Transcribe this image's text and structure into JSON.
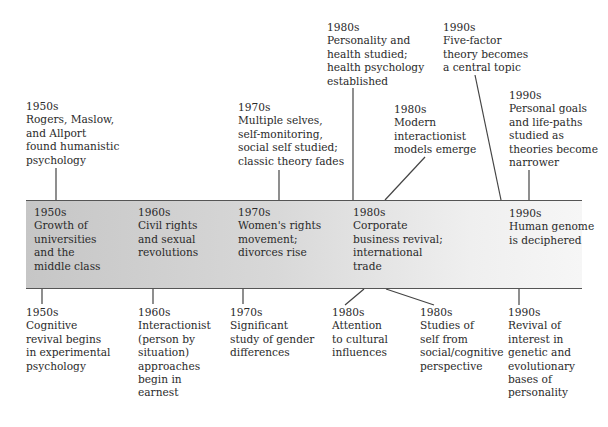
{
  "timeline": {
    "band_colors": {
      "left": "#c6c6c6",
      "right": "#f6f6f6",
      "border": "#555555"
    },
    "above": [
      {
        "era": "1950s",
        "lines": [
          "Rogers, Maslow,",
          "and Allport",
          "found humanistic",
          "psychology"
        ]
      },
      {
        "era": "1970s",
        "lines": [
          "Multiple selves,",
          "self-monitoring,",
          "social self studied;",
          "classic theory fades"
        ]
      },
      {
        "era": "1980s",
        "lines": [
          "Personality and",
          "health studied;",
          "health psychology",
          "established"
        ]
      },
      {
        "era": "1980s",
        "lines": [
          "Modern",
          "interactionist",
          "models emerge"
        ]
      },
      {
        "era": "1990s",
        "lines": [
          "Five-factor",
          "theory becomes",
          "a central topic"
        ]
      },
      {
        "era": "1990s",
        "lines": [
          "Personal goals",
          "and life-paths",
          "studied as",
          "theories become",
          "narrower"
        ]
      }
    ],
    "band": [
      {
        "era": "1950s",
        "lines": [
          "Growth of",
          "universities",
          "and the",
          "middle class"
        ]
      },
      {
        "era": "1960s",
        "lines": [
          "Civil rights",
          "and sexual",
          "revolutions"
        ]
      },
      {
        "era": "1970s",
        "lines": [
          "Women's rights",
          "movement;",
          "divorces rise"
        ]
      },
      {
        "era": "1980s",
        "lines": [
          "Corporate",
          "business revival;",
          "international",
          "trade"
        ]
      },
      {
        "era": "1990s",
        "lines": [
          "Human genome",
          "is deciphered"
        ]
      }
    ],
    "below": [
      {
        "era": "1950s",
        "lines": [
          "Cognitive",
          "revival begins",
          "in experimental",
          "psychology"
        ]
      },
      {
        "era": "1960s",
        "lines": [
          "Interactionist",
          "(person by",
          "situation)",
          "approaches",
          "begin in",
          "earnest"
        ]
      },
      {
        "era": "1970s",
        "lines": [
          "Significant",
          "study of gender",
          "differences"
        ]
      },
      {
        "era": "1980s",
        "lines": [
          "Attention",
          "to cultural",
          "influences"
        ]
      },
      {
        "era": "1980s",
        "lines": [
          "Studies of",
          "self from",
          "social/cognitive",
          "perspective"
        ]
      },
      {
        "era": "1990s",
        "lines": [
          "Revival of",
          "interest in",
          "genetic and",
          "evolutionary",
          "bases of",
          "personality"
        ]
      }
    ]
  }
}
